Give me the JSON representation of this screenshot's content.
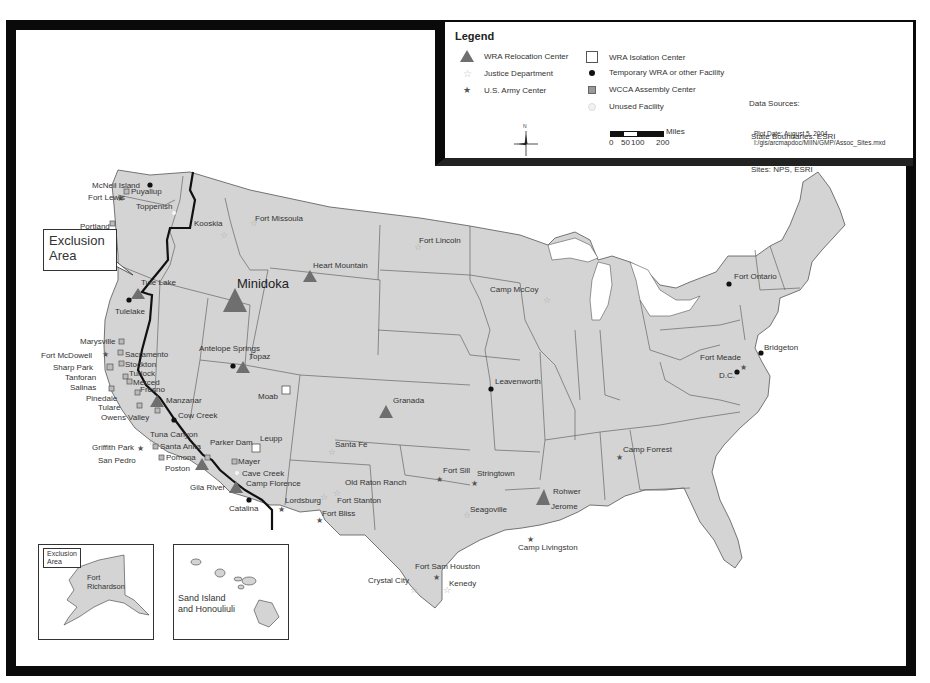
{
  "legend": {
    "title": "Legend",
    "items": [
      {
        "symbol": "triangle-icon",
        "label": "WRA Relocation Center"
      },
      {
        "symbol": "open-star-icon",
        "label": "Justice Department"
      },
      {
        "symbol": "solid-star-icon",
        "label": "U.S. Army Center"
      },
      {
        "symbol": "open-square-icon",
        "label": "WRA Isolation Center"
      },
      {
        "symbol": "black-dot-icon",
        "label": "Temporary WRA or other Facility"
      },
      {
        "symbol": "grey-square-icon",
        "label": "WCCA Assembly Center"
      },
      {
        "symbol": "white-dot-icon",
        "label": "Unused Facility"
      }
    ],
    "data_sources": {
      "heading": "Data Sources:",
      "line1": "State Boundaries: ESRI",
      "line2": "Sites: NPS, ESRI"
    },
    "scale": {
      "unit": "Miles",
      "ticks": [
        "0",
        "50",
        "100",
        "200"
      ]
    },
    "north_label": "N",
    "plot_date": "Plot Date: August 5, 2004",
    "file_path": "I:/gis/arcmapdoc/MIIN/GMP/Assoc_Sites.mxd"
  },
  "callouts": {
    "exclusion_area_line1": "Exclusion",
    "exclusion_area_line2": "Area"
  },
  "insets": {
    "alaska": {
      "callout_line1": "Exclusion",
      "callout_line2": "Area",
      "site_line1": "Fort",
      "site_line2": "Richardson"
    },
    "hawaii": {
      "site_line1": "Sand Island",
      "site_line2": "and Honouliuli"
    }
  },
  "colors": {
    "land": "#d4d4d4",
    "relocation_center": "#6f6f6f",
    "frame": "#0a0a0a",
    "exclusion_line": "#111111"
  },
  "sites": [
    {
      "name": "Minidoka",
      "type": "WRA Relocation Center"
    },
    {
      "name": "Heart Mountain",
      "type": "WRA Relocation Center"
    },
    {
      "name": "Tule Lake",
      "type": "WRA Relocation Center"
    },
    {
      "name": "Topaz",
      "type": "WRA Relocation Center"
    },
    {
      "name": "Manzanar",
      "type": "WRA Relocation Center"
    },
    {
      "name": "Poston",
      "type": "WRA Relocation Center"
    },
    {
      "name": "Gila River",
      "type": "WRA Relocation Center"
    },
    {
      "name": "Granada",
      "type": "WRA Relocation Center"
    },
    {
      "name": "Rohwer",
      "type": "WRA Relocation Center"
    },
    {
      "name": "Jerome",
      "type": "WRA Relocation Center"
    },
    {
      "name": "Moab",
      "type": "WRA Isolation Center"
    },
    {
      "name": "Leupp",
      "type": "WRA Isolation Center"
    },
    {
      "name": "Fort Missoula",
      "type": "Justice Department"
    },
    {
      "name": "Kooskia",
      "type": "Justice Department"
    },
    {
      "name": "Fort Lincoln",
      "type": "Justice Department"
    },
    {
      "name": "Camp McCoy",
      "type": "Justice Department"
    },
    {
      "name": "Santa Fe",
      "type": "Justice Department"
    },
    {
      "name": "Old Raton Ranch",
      "type": "Justice Department"
    },
    {
      "name": "Fort Stanton",
      "type": "Justice Department"
    },
    {
      "name": "Seagoville",
      "type": "Justice Department"
    },
    {
      "name": "Crystal City",
      "type": "Justice Department"
    },
    {
      "name": "Kenedy",
      "type": "Justice Department"
    },
    {
      "name": "Tuna Canyon",
      "type": "Justice Department"
    },
    {
      "name": "Fort Lewis",
      "type": "U.S. Army Center"
    },
    {
      "name": "Fort McDowell",
      "type": "U.S. Army Center"
    },
    {
      "name": "Griffith Park",
      "type": "U.S. Army Center"
    },
    {
      "name": "Lordsburg",
      "type": "U.S. Army Center"
    },
    {
      "name": "Fort Bliss",
      "type": "U.S. Army Center"
    },
    {
      "name": "Fort Sill",
      "type": "U.S. Army Center"
    },
    {
      "name": "Stringtown",
      "type": "U.S. Army Center"
    },
    {
      "name": "Camp Livingston",
      "type": "U.S. Army Center"
    },
    {
      "name": "Fort Sam Houston",
      "type": "U.S. Army Center"
    },
    {
      "name": "Camp Forrest",
      "type": "U.S. Army Center"
    },
    {
      "name": "Fort Meade",
      "type": "U.S. Army Center"
    },
    {
      "name": "McNeil Island",
      "type": "Temporary WRA or other Facility"
    },
    {
      "name": "Tulelake",
      "type": "Temporary WRA or other Facility"
    },
    {
      "name": "Antelope Springs",
      "type": "Temporary WRA or other Facility"
    },
    {
      "name": "Cow Creek",
      "type": "Temporary WRA or other Facility"
    },
    {
      "name": "Catalina",
      "type": "Temporary WRA or other Facility"
    },
    {
      "name": "Leavenworth",
      "type": "Temporary WRA or other Facility"
    },
    {
      "name": "Fort Ontario",
      "type": "Temporary WRA or other Facility"
    },
    {
      "name": "Bridgeton",
      "type": "Temporary WRA or other Facility"
    },
    {
      "name": "D.C.",
      "type": "Temporary WRA or other Facility"
    },
    {
      "name": "Puyallup",
      "type": "WCCA Assembly Center"
    },
    {
      "name": "Portland",
      "type": "WCCA Assembly Center"
    },
    {
      "name": "Marysville",
      "type": "WCCA Assembly Center"
    },
    {
      "name": "Sacramento",
      "type": "WCCA Assembly Center"
    },
    {
      "name": "Stockton",
      "type": "WCCA Assembly Center"
    },
    {
      "name": "Sharp Park",
      "type": "WCCA Assembly Center"
    },
    {
      "name": "Tanforan",
      "type": "WCCA Assembly Center"
    },
    {
      "name": "Turlock",
      "type": "WCCA Assembly Center"
    },
    {
      "name": "Merced",
      "type": "WCCA Assembly Center"
    },
    {
      "name": "Salinas",
      "type": "WCCA Assembly Center"
    },
    {
      "name": "Fresno",
      "type": "WCCA Assembly Center"
    },
    {
      "name": "Pinedale",
      "type": "WCCA Assembly Center"
    },
    {
      "name": "Tulare",
      "type": "WCCA Assembly Center"
    },
    {
      "name": "Owens Valley",
      "type": "WCCA Assembly Center"
    },
    {
      "name": "Santa Anita",
      "type": "WCCA Assembly Center"
    },
    {
      "name": "Pomona",
      "type": "WCCA Assembly Center"
    },
    {
      "name": "San Pedro",
      "type": "WCCA Assembly Center"
    },
    {
      "name": "Parker Dam",
      "type": "WCCA Assembly Center"
    },
    {
      "name": "Mayer",
      "type": "WCCA Assembly Center"
    },
    {
      "name": "Toppenish",
      "type": "Unused Facility"
    },
    {
      "name": "Cave Creek",
      "type": "Unused Facility"
    },
    {
      "name": "Camp Florence",
      "type": "Unused Facility"
    }
  ]
}
